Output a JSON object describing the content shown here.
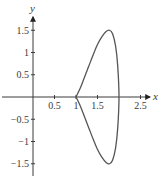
{
  "chart_data": {
    "type": "line",
    "title": "",
    "xlabel": "x",
    "ylabel": "y",
    "xlim": [
      -0.75,
      3.0
    ],
    "ylim": [
      -1.85,
      2.0
    ],
    "grid": false,
    "legend": null,
    "x_ticks": [
      0.5,
      1,
      1.5,
      2.5
    ],
    "x_tick_labels": [
      "0.5",
      "1",
      "1.5",
      "2.5"
    ],
    "y_ticks": [
      1.5,
      1,
      0.5,
      -0.5,
      -1,
      -1.5
    ],
    "y_tick_labels": [
      "1.5",
      "1",
      "0.5",
      "−0.5",
      "−1",
      "−1.5"
    ],
    "series": [
      {
        "name": "closed curve",
        "x": [
          1.0,
          1.1,
          1.2,
          1.3,
          1.4,
          1.5,
          1.6,
          1.7,
          1.78,
          1.85,
          1.92,
          1.97,
          2.0,
          1.97,
          1.92,
          1.85,
          1.78,
          1.7,
          1.6,
          1.5,
          1.4,
          1.3,
          1.2,
          1.1,
          1.0
        ],
        "y": [
          0.0,
          0.2,
          0.45,
          0.7,
          0.95,
          1.18,
          1.35,
          1.47,
          1.5,
          1.42,
          1.15,
          0.7,
          0.0,
          -0.7,
          -1.15,
          -1.42,
          -1.5,
          -1.47,
          -1.35,
          -1.18,
          -0.95,
          -0.7,
          -0.45,
          -0.2,
          0.0
        ]
      }
    ]
  },
  "axes": {
    "x_label": "x",
    "y_label": "y"
  },
  "colors": {
    "axis": "#3a3a3a",
    "curve": "#555555"
  }
}
